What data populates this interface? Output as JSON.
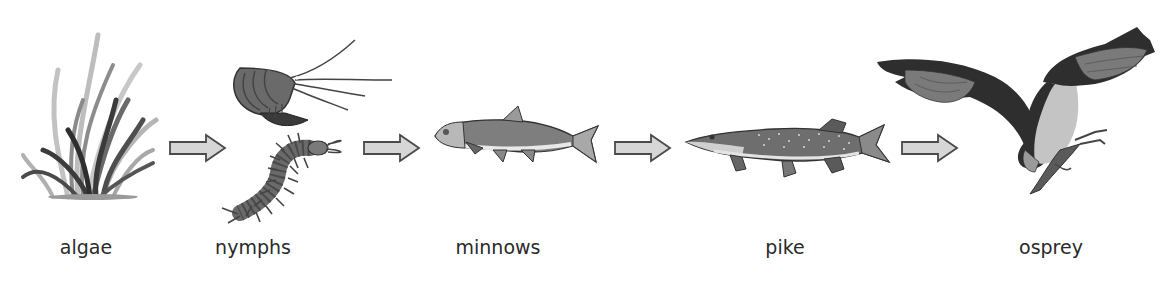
{
  "diagram": {
    "type": "food-chain",
    "nodes": [
      {
        "id": "algae",
        "label": "algae",
        "icon": "algae-icon",
        "x": 86
      },
      {
        "id": "nymphs",
        "label": "nymphs",
        "icon": "nymph-icon",
        "x": 253
      },
      {
        "id": "minnows",
        "label": "minnows",
        "icon": "minnow-icon",
        "x": 498
      },
      {
        "id": "pike",
        "label": "pike",
        "icon": "pike-icon",
        "x": 785
      },
      {
        "id": "osprey",
        "label": "osprey",
        "icon": "osprey-icon",
        "x": 1051
      }
    ],
    "edges": [
      {
        "from": "algae",
        "to": "nymphs"
      },
      {
        "from": "nymphs",
        "to": "minnows"
      },
      {
        "from": "minnows",
        "to": "pike"
      },
      {
        "from": "pike",
        "to": "osprey"
      }
    ],
    "colors": {
      "arrow_fill": "#d6d6d6",
      "arrow_stroke": "#4a4a4a",
      "label_text": "#2a2a2a",
      "dark": "#3a3a3a",
      "mid": "#7a7a7a",
      "light": "#c4c4c4"
    }
  }
}
